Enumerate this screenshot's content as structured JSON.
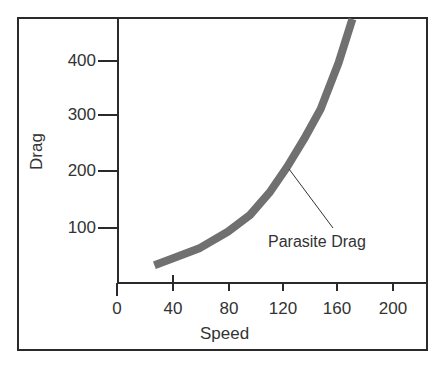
{
  "chart_data": {
    "type": "line",
    "title": "",
    "xlabel": "Speed",
    "ylabel": "Drag",
    "xlim": [
      0,
      225
    ],
    "ylim": [
      0,
      480
    ],
    "x_ticks": [
      0,
      40,
      80,
      120,
      160,
      200
    ],
    "y_ticks": [
      100,
      200,
      300,
      400
    ],
    "grid": false,
    "legend": null,
    "series": [
      {
        "name": "Parasite Drag",
        "color": "#707070",
        "x": [
          27,
          40,
          60,
          80,
          96,
          110,
          123,
          135,
          147,
          160,
          170
        ],
        "y": [
          32,
          44,
          63,
          92,
          122,
          162,
          209,
          258,
          312,
          395,
          474
        ]
      }
    ],
    "annotations": [
      {
        "text": "Parasite Drag",
        "target_x": 123,
        "target_y": 209
      }
    ]
  },
  "labels": {
    "y_ticks": [
      "400",
      "300",
      "200",
      "100"
    ],
    "x_ticks": [
      "0",
      "40",
      "80",
      "120",
      "160",
      "200"
    ],
    "xlabel": "Speed",
    "ylabel": "Drag",
    "annotation": "Parasite Drag"
  }
}
